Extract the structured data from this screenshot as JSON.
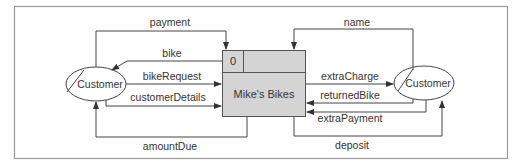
{
  "diagram": {
    "type": "data-flow-diagram",
    "process": {
      "id": "0",
      "name": "Mike's Bikes",
      "fill": "#d4d4d4"
    },
    "entities": [
      {
        "id": "left",
        "name": "Customer"
      },
      {
        "id": "right",
        "name": "Customer"
      }
    ],
    "flows": {
      "payment": "payment",
      "bike": "bike",
      "bikeRequest": "bikeRequest",
      "customerDetails": "customerDetails",
      "amountDue": "amountDue",
      "name": "name",
      "extraCharge": "extraCharge",
      "returnedBike": "returnedBike",
      "extraPayment": "extraPayment",
      "deposit": "deposit"
    },
    "colors": {
      "line": "#444444",
      "frame": "#9a9a9a",
      "process_fill": "#d4d4d4"
    }
  }
}
